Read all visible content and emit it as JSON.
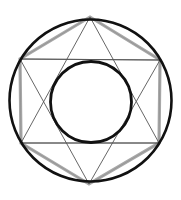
{
  "figure": {
    "title": "",
    "colors": {
      "background": "#ffffff",
      "circle_stroke": "#111111",
      "hexagon_stroke": "#a8a8a8",
      "line_stroke": "#555555"
    },
    "outer_circle": {
      "cx": 90.5,
      "cy": 100.5,
      "r": 81
    },
    "inner_circle": {
      "cx": 91,
      "cy": 102,
      "r": 40.5
    },
    "hexagon_vertices": [
      [
        90,
        17
      ],
      [
        160,
        60
      ],
      [
        159,
        143
      ],
      [
        89,
        184
      ],
      [
        21,
        143
      ],
      [
        20,
        59
      ]
    ],
    "triangle_up": [
      [
        90,
        17
      ],
      [
        159,
        143
      ],
      [
        21,
        143
      ]
    ],
    "triangle_down": [
      [
        89,
        184
      ],
      [
        160,
        60
      ],
      [
        20,
        59
      ]
    ],
    "horizontal_chords": [
      [
        [
          20,
          59
        ],
        [
          160,
          60
        ]
      ],
      [
        [
          21,
          143
        ],
        [
          159,
          143
        ]
      ]
    ]
  }
}
